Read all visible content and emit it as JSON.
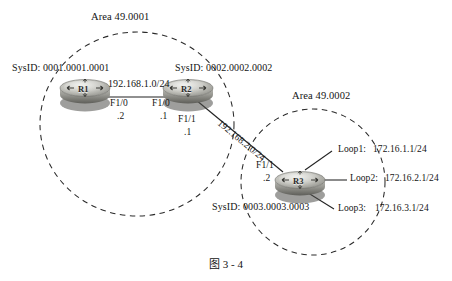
{
  "figure": {
    "caption": "图 3 - 4",
    "areas": [
      {
        "id": "area-1",
        "label": "Area 49.0001"
      },
      {
        "id": "area-2",
        "label": "Area 49.0002"
      }
    ]
  },
  "routers": [
    {
      "id": "r1",
      "name": "R1",
      "sysid_prefix": "SysID:",
      "sysid_value": "0001.0001.0001",
      "sysid_text": "SysID: 0001.0001.0001",
      "area": "Area 49.0001"
    },
    {
      "id": "r2",
      "name": "R2",
      "sysid_prefix": "SysID:",
      "sysid_value": "0002.0002.0002",
      "sysid_text": "SysID: 0002.0002.0002",
      "area": "Area 49.0001"
    },
    {
      "id": "r3",
      "name": "R3",
      "sysid_prefix": "SysID:",
      "sysid_value": "0003.0003.0003",
      "sysid_text": "SysID: 0003.0003.0003",
      "area": "Area 49.0002"
    }
  ],
  "links": [
    {
      "id": "link-r1-r2",
      "network": "192.168.1.0/24",
      "endpoints": [
        {
          "router": "R1",
          "interface": "F1/0",
          "host_octet": ".2"
        },
        {
          "router": "R2",
          "interface": "F1/0",
          "host_octet": ".1"
        }
      ]
    },
    {
      "id": "link-r2-r3",
      "network": "192.168.2.0/24",
      "endpoints": [
        {
          "router": "R2",
          "interface": "F1/1",
          "host_octet": ".1"
        },
        {
          "router": "R3",
          "interface": "F1/1",
          "host_octet": ".2"
        }
      ]
    }
  ],
  "loopbacks": [
    {
      "id": "loop1",
      "label": "Loop1:",
      "address": "172.16.1.1/24"
    },
    {
      "id": "loop2",
      "label": "Loop2:",
      "address": "172.16.2.1/24"
    },
    {
      "id": "loop3",
      "label": "Loop3:",
      "address": "172.16.3.1/24"
    }
  ],
  "colors": {
    "background": "#ffffff",
    "line": "#262626",
    "dashed_circle": "#2a2a2a",
    "router_body_top": "#cfcfc9",
    "router_body_bottom": "#6d6d68",
    "text": "#141414"
  }
}
